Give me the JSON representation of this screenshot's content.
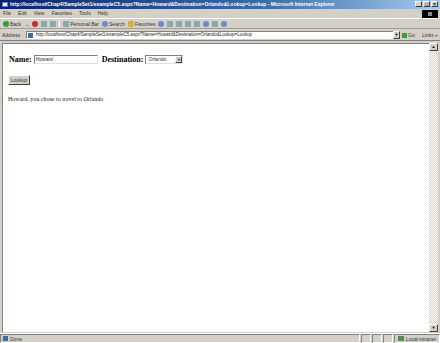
{
  "window": {
    "title": "http://localhost/Chap4/SampleSet1/exampleC5.aspx?Name=Howard&Destination=Orlando&Lookup=Lookup - Microsoft Internet Explorer",
    "controls": {
      "minimize": "_",
      "maximize": "□",
      "close": "×"
    }
  },
  "menu": {
    "items": [
      "File",
      "Edit",
      "View",
      "Favorites",
      "Tools",
      "Help"
    ]
  },
  "toolbar": {
    "back_label": "Back",
    "forward_label": "→",
    "personal_bar_label": "Personal Bar",
    "search_label": "Search",
    "favorites_label": "Favorites"
  },
  "address": {
    "label": "Address",
    "url": "http://localhost/Chap4/SampleSet1/exampleC5.aspx?Name=Howard&Destination=Orlando&Lookup=Lookup",
    "go_label": "Go",
    "links_label": "Links »"
  },
  "page": {
    "name_label": "Name:",
    "name_value": "Howard",
    "destination_label": "Destination:",
    "destination_value": "Orlando",
    "lookup_button": "Lookup",
    "result_text": "Howard, you chose to travel to Orlando"
  },
  "status": {
    "text": "Done",
    "zone": "Local intranet"
  }
}
